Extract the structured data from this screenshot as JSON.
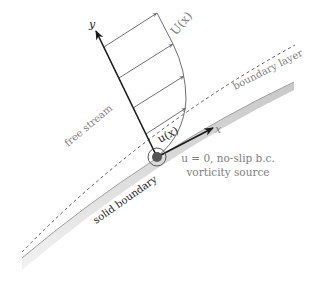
{
  "diagram": {
    "colors": {
      "background": "#ffffff",
      "axis": "#1a1a1a",
      "profile_arrows": "#707070",
      "label_gray": "#808080",
      "wall_fill": "#d9d9d9",
      "wall_edge": "#a0a0a0",
      "dashed_line": "#555555",
      "origin_dot": "#555555"
    },
    "labels": {
      "y_axis": "y",
      "x_axis": "x",
      "profile": "U(x)",
      "local_velocity": "u(x)",
      "free_stream": "free stream",
      "boundary_layer": "boundary layer",
      "solid_boundary": "solid boundary",
      "noslip_line1": "u = 0, no-slip b.c.",
      "noslip_line2": "vorticity source"
    },
    "elements": {
      "y_axis": {
        "from": [
          157,
          157
        ],
        "to": [
          96,
          31
        ]
      },
      "x_axis": {
        "from": [
          157,
          157
        ],
        "to": [
          213,
          128
        ]
      },
      "profile_arrow_count": 4,
      "origin": [
        157,
        157
      ]
    }
  }
}
